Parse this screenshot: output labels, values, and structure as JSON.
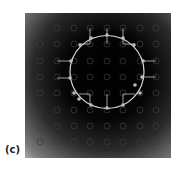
{
  "panel": {
    "label": "(c)"
  },
  "figure": {
    "x": 25,
    "y": 13,
    "width": 146,
    "height": 145,
    "background": {
      "type": "radial-gradient",
      "center": [
        82,
        62
      ],
      "stops": [
        {
          "offset": 0,
          "color": "#000000"
        },
        {
          "offset": 0.35,
          "color": "#050505"
        },
        {
          "offset": 0.6,
          "color": "#2a2a2a"
        },
        {
          "offset": 0.85,
          "color": "#7a7a7a"
        },
        {
          "offset": 1,
          "color": "#cfcfcf"
        }
      ]
    },
    "grid_circles": {
      "color": "#3a3a3a",
      "radius": 3,
      "xs": [
        15,
        32,
        49,
        65,
        82,
        98,
        115,
        131
      ],
      "ys": [
        15,
        31,
        48,
        64,
        80,
        97,
        113,
        129
      ]
    },
    "boundary_circle": {
      "cx": 82,
      "cy": 59,
      "rx": 37,
      "ry": 36.5,
      "color": "#d8d8d8"
    },
    "marker_color": "#bdbdbd",
    "markers": [
      [
        82,
        22
      ],
      [
        66,
        25
      ],
      [
        98,
        25
      ],
      [
        55,
        32
      ],
      [
        109,
        32
      ],
      [
        46,
        48
      ],
      [
        118,
        48
      ],
      [
        45,
        65
      ],
      [
        117,
        64
      ],
      [
        49,
        80
      ],
      [
        115,
        80
      ],
      [
        54,
        86
      ],
      [
        110,
        72
      ],
      [
        66,
        92
      ],
      [
        98,
        92
      ],
      [
        82,
        95
      ]
    ],
    "connector_color": "#a9a9a9",
    "connectors": [
      [
        [
          82,
          15
        ],
        [
          82,
          31
        ]
      ],
      [
        [
          65,
          15
        ],
        [
          65,
          31
        ],
        [
          54,
          31
        ]
      ],
      [
        [
          98,
          15
        ],
        [
          98,
          31
        ],
        [
          110,
          31
        ]
      ],
      [
        [
          32,
          48
        ],
        [
          46,
          48
        ]
      ],
      [
        [
          118,
          48
        ],
        [
          131,
          48
        ]
      ],
      [
        [
          32,
          65
        ],
        [
          45,
          65
        ]
      ],
      [
        [
          117,
          64
        ],
        [
          131,
          64
        ]
      ],
      [
        [
          54,
          81
        ],
        [
          65,
          81
        ],
        [
          65,
          92
        ]
      ],
      [
        [
          110,
          81
        ],
        [
          98,
          81
        ],
        [
          98,
          92
        ]
      ],
      [
        [
          82,
          81
        ],
        [
          82,
          95
        ]
      ]
    ]
  }
}
